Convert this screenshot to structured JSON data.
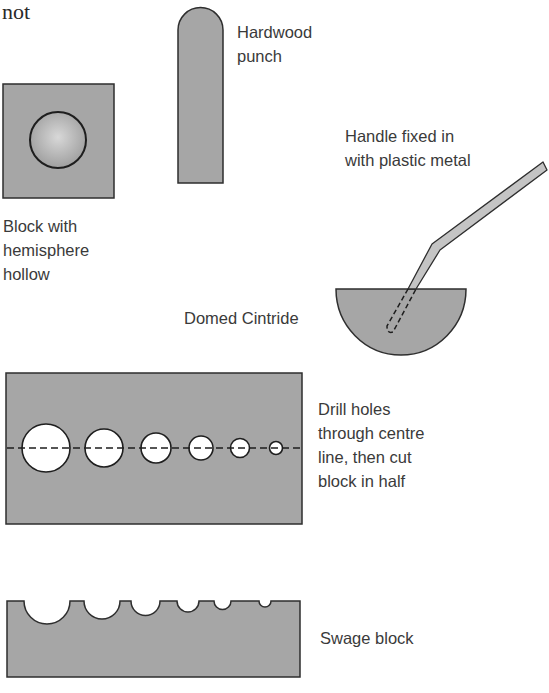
{
  "page_fragment_text": "not",
  "colors": {
    "fill_grey": "#a6a6a6",
    "outline": "#2e2e2e",
    "hollow_white": "#ffffff",
    "handle_fill": "#c4c4c4",
    "text": "#3a3a3a"
  },
  "items": {
    "hardwood_punch": {
      "label": "Hardwood\npunch"
    },
    "block_hemisphere": {
      "label": "Block with\nhemisphere\nhollow"
    },
    "handle": {
      "label": "Handle fixed in\nwith plastic metal"
    },
    "domed_cintride": {
      "label": "Domed Cintride"
    },
    "drilled_block": {
      "label": "Drill holes\nthrough centre\nline, then cut\nblock in half",
      "hole_count": 6
    },
    "swage_block": {
      "label": "Swage block",
      "groove_count": 6
    }
  }
}
